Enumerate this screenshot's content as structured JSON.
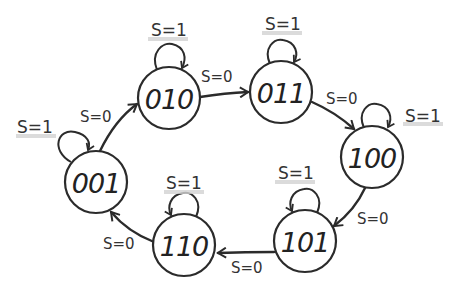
{
  "diagram": {
    "type": "state-machine",
    "states": [
      {
        "id": "001",
        "label": "001",
        "cx": 96,
        "cy": 182
      },
      {
        "id": "010",
        "label": "010",
        "cx": 169,
        "cy": 98
      },
      {
        "id": "011",
        "label": "011",
        "cx": 281,
        "cy": 92
      },
      {
        "id": "100",
        "label": "100",
        "cx": 372,
        "cy": 157
      },
      {
        "id": "101",
        "label": "101",
        "cx": 305,
        "cy": 241
      },
      {
        "id": "110",
        "label": "110",
        "cx": 184,
        "cy": 245
      }
    ],
    "transitions": [
      {
        "from": "001",
        "to": "010",
        "label": "S=0"
      },
      {
        "from": "010",
        "to": "011",
        "label": "S=0"
      },
      {
        "from": "011",
        "to": "100",
        "label": "S=0"
      },
      {
        "from": "100",
        "to": "101",
        "label": "S=0"
      },
      {
        "from": "101",
        "to": "110",
        "label": "S=0"
      },
      {
        "from": "110",
        "to": "001",
        "label": "S=0"
      }
    ],
    "self_loops": [
      {
        "state": "001",
        "label": "S=1"
      },
      {
        "state": "010",
        "label": "S=1"
      },
      {
        "state": "011",
        "label": "S=1"
      },
      {
        "state": "100",
        "label": "S=1"
      },
      {
        "state": "101",
        "label": "S=1"
      },
      {
        "state": "110",
        "label": "S=1"
      }
    ]
  }
}
